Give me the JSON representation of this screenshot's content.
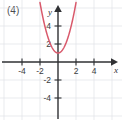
{
  "figure": {
    "item_label": "(4)",
    "background_color": "#ffffff",
    "grid_color": "#dfe2e6",
    "axis_color": "#2f3033",
    "curve_color": "#d9596b"
  },
  "chart_data": {
    "type": "line",
    "title": "(4)",
    "xlabel": "x",
    "ylabel": "y",
    "xlim": [
      -6.4,
      6.9
    ],
    "ylim": [
      -6.4,
      6.0
    ],
    "grid": true,
    "grid_step": 2,
    "legend": null,
    "x_ticks": [
      -4,
      -2,
      2,
      4
    ],
    "x_tick_labels": [
      "-4",
      "-2",
      "2",
      "4"
    ],
    "y_ticks": [
      -4,
      -2,
      2,
      4
    ],
    "y_tick_labels": [
      "-4",
      "-2",
      "2",
      "4"
    ],
    "series": [
      {
        "name": "parabola",
        "equation": "y = 1.4x^2 + 1",
        "vertex": [
          0,
          1
        ],
        "color": "#d9596b",
        "x": [
          -1.9,
          -1.7,
          -1.5,
          -1.3,
          -1.1,
          -0.9,
          -0.7,
          -0.5,
          -0.3,
          -0.1,
          0,
          0.1,
          0.3,
          0.5,
          0.7,
          0.9,
          1.1,
          1.3,
          1.5,
          1.7,
          1.9
        ],
        "y": [
          6.05,
          5.05,
          4.15,
          3.37,
          2.69,
          2.13,
          1.69,
          1.35,
          1.13,
          1.01,
          1.0,
          1.01,
          1.13,
          1.35,
          1.69,
          2.13,
          2.69,
          3.37,
          4.15,
          5.05,
          6.05
        ]
      }
    ]
  }
}
